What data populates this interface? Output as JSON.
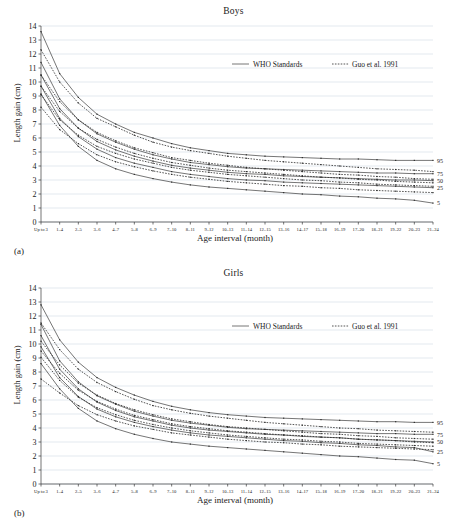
{
  "figure": {
    "panels": [
      {
        "tag": "(a)",
        "title": "Boys"
      },
      {
        "tag": "(b)",
        "title": "Girls"
      }
    ]
  },
  "axes": {
    "ylabel": "Length gain (cm)",
    "xlabel": "Age interval (month)",
    "y_ticks": [
      "0",
      "1",
      "2",
      "3",
      "4",
      "5",
      "6",
      "7",
      "8",
      "9",
      "10",
      "11",
      "12",
      "13",
      "14"
    ],
    "x_ticks": [
      "Up to 3",
      "1–4",
      "2–5",
      "3–6",
      "4–7",
      "5–8",
      "6–9",
      "7–10",
      "8–11",
      "9–12",
      "10–13",
      "11–14",
      "12–15",
      "13–16",
      "14–17",
      "15–18",
      "16–19",
      "17–20",
      "18–21",
      "19–22",
      "20–23",
      "21–24"
    ]
  },
  "legend": {
    "who_label": "WHO Standards",
    "guo_label": "Guo et al. 1991"
  },
  "percentile_labels": [
    "95",
    "75",
    "50",
    "25",
    "5"
  ],
  "colors": {
    "line": "#2b2b2b",
    "grid": "#b9c4d4",
    "axis": "#3a3a3a",
    "background": "#ffffff"
  },
  "chart_data": {
    "type": "line",
    "xlabel": "Age interval (month)",
    "ylabel": "Length gain (cm)",
    "ylim": [
      0,
      14
    ],
    "grid": true,
    "legend_position": "upper-right",
    "categories": [
      "Up to 3",
      "1–4",
      "2–5",
      "3–6",
      "4–7",
      "5–8",
      "6–9",
      "7–10",
      "8–11",
      "9–12",
      "10–13",
      "11–14",
      "12–15",
      "13–16",
      "14–17",
      "15–18",
      "16–19",
      "17–20",
      "18–21",
      "19–22",
      "20–23",
      "21–24"
    ],
    "panels": [
      {
        "name": "Boys",
        "tag": "(a)",
        "series": [
          {
            "name": "WHO P95",
            "style": "solid",
            "values": [
              13.6,
              10.6,
              8.9,
              7.7,
              7.0,
              6.4,
              6.0,
              5.6,
              5.3,
              5.1,
              4.9,
              4.8,
              4.7,
              4.65,
              4.6,
              4.55,
              4.5,
              4.5,
              4.45,
              4.4,
              4.4,
              4.4
            ]
          },
          {
            "name": "WHO P75",
            "style": "solid",
            "values": [
              11.4,
              8.8,
              7.3,
              6.3,
              5.7,
              5.2,
              4.8,
              4.5,
              4.25,
              4.1,
              3.95,
              3.85,
              3.8,
              3.75,
              3.7,
              3.65,
              3.6,
              3.55,
              3.5,
              3.5,
              3.45,
              3.45
            ]
          },
          {
            "name": "WHO P50",
            "style": "solid",
            "values": [
              10.5,
              8.1,
              6.7,
              5.75,
              5.15,
              4.7,
              4.35,
              4.05,
              3.85,
              3.7,
              3.55,
              3.45,
              3.4,
              3.3,
              3.25,
              3.2,
              3.15,
              3.1,
              3.05,
              3.0,
              3.0,
              2.95
            ]
          },
          {
            "name": "WHO P25",
            "style": "solid",
            "values": [
              9.7,
              7.4,
              6.1,
              5.2,
              4.6,
              4.2,
              3.9,
              3.6,
              3.4,
              3.25,
              3.1,
              3.0,
              2.95,
              2.85,
              2.8,
              2.75,
              2.7,
              2.65,
              2.6,
              2.55,
              2.5,
              2.45
            ]
          },
          {
            "name": "WHO P5",
            "style": "solid",
            "values": [
              9.15,
              6.9,
              5.4,
              4.4,
              3.8,
              3.4,
              3.1,
              2.85,
              2.65,
              2.5,
              2.4,
              2.3,
              2.2,
              2.1,
              2.0,
              1.95,
              1.85,
              1.8,
              1.7,
              1.65,
              1.55,
              1.35
            ]
          },
          {
            "name": "Guo P95",
            "style": "dotted",
            "values": [
              12.3,
              10.0,
              8.5,
              7.4,
              6.8,
              6.2,
              5.7,
              5.35,
              5.1,
              4.9,
              4.7,
              4.55,
              4.4,
              4.3,
              4.2,
              4.1,
              4.0,
              3.9,
              3.8,
              3.75,
              3.7,
              3.6
            ]
          },
          {
            "name": "Guo P75",
            "style": "dotted",
            "values": [
              10.5,
              8.6,
              7.3,
              6.4,
              5.8,
              5.3,
              4.95,
              4.6,
              4.4,
              4.2,
              4.05,
              3.9,
              3.8,
              3.7,
              3.6,
              3.5,
              3.4,
              3.35,
              3.25,
              3.2,
              3.1,
              3.05
            ]
          },
          {
            "name": "Guo P50",
            "style": "dotted",
            "values": [
              9.7,
              7.9,
              6.7,
              5.9,
              5.35,
              4.9,
              4.55,
              4.25,
              4.05,
              3.85,
              3.7,
              3.6,
              3.5,
              3.4,
              3.3,
              3.2,
              3.15,
              3.05,
              3.0,
              2.9,
              2.85,
              2.8
            ]
          },
          {
            "name": "Guo P25",
            "style": "dotted",
            "values": [
              9.1,
              7.3,
              6.2,
              5.4,
              4.9,
              4.5,
              4.2,
              3.9,
              3.7,
              3.55,
              3.4,
              3.3,
              3.2,
              3.1,
              3.0,
              2.95,
              2.85,
              2.8,
              2.7,
              2.65,
              2.6,
              2.55
            ]
          },
          {
            "name": "Guo P5",
            "style": "dotted",
            "values": [
              8.2,
              6.6,
              5.6,
              4.8,
              4.3,
              3.95,
              3.65,
              3.4,
              3.2,
              3.05,
              2.9,
              2.8,
              2.7,
              2.6,
              2.55,
              2.45,
              2.4,
              2.3,
              2.25,
              2.2,
              2.15,
              2.1
            ]
          }
        ],
        "right_labels": [
          {
            "text": "95",
            "value": 4.4
          },
          {
            "text": "75",
            "value": 3.45
          },
          {
            "text": "50",
            "value": 2.95
          },
          {
            "text": "25",
            "value": 2.45
          },
          {
            "text": "5",
            "value": 1.35
          }
        ]
      },
      {
        "name": "Girls",
        "tag": "(b)",
        "series": [
          {
            "name": "WHO P95",
            "style": "solid",
            "values": [
              12.8,
              10.3,
              8.7,
              7.6,
              6.9,
              6.35,
              5.9,
              5.55,
              5.3,
              5.1,
              4.95,
              4.85,
              4.75,
              4.7,
              4.65,
              4.6,
              4.55,
              4.5,
              4.45,
              4.45,
              4.4,
              4.4
            ]
          },
          {
            "name": "WHO P75",
            "style": "solid",
            "values": [
              11.4,
              8.8,
              7.3,
              6.3,
              5.7,
              5.2,
              4.85,
              4.55,
              4.35,
              4.2,
              4.05,
              3.95,
              3.9,
              3.85,
              3.8,
              3.75,
              3.7,
              3.65,
              3.6,
              3.6,
              3.55,
              3.55
            ]
          },
          {
            "name": "WHO P50",
            "style": "solid",
            "values": [
              10.6,
              8.2,
              6.8,
              5.85,
              5.25,
              4.8,
              4.5,
              4.2,
              4.0,
              3.85,
              3.75,
              3.65,
              3.55,
              3.5,
              3.4,
              3.35,
              3.3,
              3.2,
              3.15,
              3.1,
              3.05,
              3.0
            ]
          },
          {
            "name": "WHO P25",
            "style": "solid",
            "values": [
              9.8,
              7.6,
              6.25,
              5.35,
              4.8,
              4.4,
              4.1,
              3.85,
              3.65,
              3.5,
              3.4,
              3.3,
              3.2,
              3.1,
              3.05,
              2.95,
              2.9,
              2.8,
              2.75,
              2.65,
              2.6,
              2.3
            ]
          },
          {
            "name": "WHO P5",
            "style": "solid",
            "values": [
              8.6,
              6.8,
              5.4,
              4.5,
              3.95,
              3.55,
              3.25,
              3.0,
              2.85,
              2.7,
              2.6,
              2.5,
              2.4,
              2.3,
              2.2,
              2.1,
              2.0,
              1.95,
              1.85,
              1.75,
              1.7,
              1.45
            ]
          },
          {
            "name": "Guo P95",
            "style": "dotted",
            "values": [
              11.5,
              9.6,
              8.2,
              7.25,
              6.6,
              6.05,
              5.6,
              5.3,
              5.05,
              4.85,
              4.7,
              4.55,
              4.4,
              4.3,
              4.2,
              4.1,
              4.0,
              3.95,
              3.85,
              3.8,
              3.75,
              3.7
            ]
          },
          {
            "name": "Guo P75",
            "style": "dotted",
            "values": [
              10.2,
              8.5,
              7.2,
              6.35,
              5.75,
              5.3,
              4.95,
              4.65,
              4.45,
              4.25,
              4.1,
              4.0,
              3.9,
              3.8,
              3.7,
              3.6,
              3.55,
              3.45,
              3.4,
              3.3,
              3.25,
              3.2
            ]
          },
          {
            "name": "Guo P50",
            "style": "dotted",
            "values": [
              9.5,
              7.9,
              6.7,
              5.9,
              5.35,
              4.9,
              4.6,
              4.3,
              4.1,
              3.95,
              3.8,
              3.7,
              3.6,
              3.5,
              3.45,
              3.35,
              3.3,
              3.2,
              3.15,
              3.1,
              3.0,
              2.95
            ]
          },
          {
            "name": "Guo P25",
            "style": "dotted",
            "values": [
              9.05,
              7.4,
              6.2,
              5.45,
              4.95,
              4.55,
              4.25,
              4.0,
              3.8,
              3.65,
              3.5,
              3.4,
              3.3,
              3.2,
              3.15,
              3.05,
              3.0,
              2.9,
              2.85,
              2.8,
              2.75,
              2.7
            ]
          },
          {
            "name": "Guo P5",
            "style": "dotted",
            "values": [
              7.5,
              6.5,
              5.6,
              4.95,
              4.5,
              4.15,
              3.9,
              3.65,
              3.5,
              3.35,
              3.2,
              3.1,
              3.0,
              2.95,
              2.85,
              2.8,
              2.7,
              2.65,
              2.6,
              2.55,
              2.5,
              2.45
            ]
          }
        ],
        "right_labels": [
          {
            "text": "95",
            "value": 4.4
          },
          {
            "text": "75",
            "value": 3.55
          },
          {
            "text": "50",
            "value": 3.0
          },
          {
            "text": "25",
            "value": 2.3
          },
          {
            "text": "5",
            "value": 1.45
          }
        ]
      }
    ]
  }
}
